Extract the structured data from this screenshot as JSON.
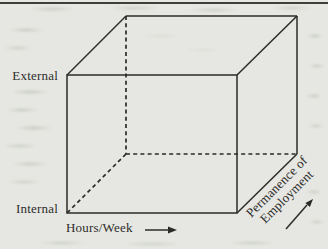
{
  "diagram": {
    "type": "3d-cube-axes",
    "vertical_axis": {
      "top_label": "External",
      "bottom_label": "Internal"
    },
    "horizontal_axis": {
      "label": "Hours/Week",
      "arrow_direction": "right"
    },
    "depth_axis": {
      "label_line1": "Permanence of",
      "label_line2": "Employment",
      "arrow_direction": "up-right"
    },
    "colors": {
      "paper": "#e6e7e2",
      "line": "#2c2b28",
      "text": "#2d2c2a"
    }
  }
}
